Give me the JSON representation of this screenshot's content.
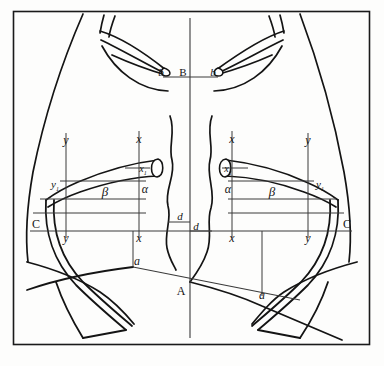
{
  "figure": {
    "background_color": "#fdfdfc",
    "ink_color": "#141414",
    "frame": {
      "stroke": "#1a1a1a",
      "x": 13,
      "y": 11,
      "width": 357,
      "height": 334
    }
  },
  "axes": {
    "midline_label": "vertical-midline",
    "midline_x": 190,
    "baseline_label": "horizontal-baseline",
    "baseline_y": 231
  },
  "labels": {
    "top_center": "B",
    "top_left_clavicle": "b",
    "top_right_clavicle": "b",
    "bottom_center": "A",
    "bottom_left_rib": "a",
    "bottom_right_rib": "a",
    "left_outer": "C",
    "right_outer": "C",
    "left_y_top": "y",
    "right_y_top": "y",
    "left_y_base": "y",
    "right_y_base": "y",
    "left_y_sub": "y",
    "right_y_sub": "y",
    "left_x_top": "x",
    "right_x_top": "x",
    "left_x_base": "x",
    "right_x_base": "x",
    "left_x_sub": "x",
    "right_x_sub": "x",
    "subscript": "1",
    "left_alpha": "α",
    "right_alpha": "α",
    "left_beta": "β",
    "right_beta": "β",
    "left_d": "d",
    "right_d": "d"
  },
  "measurement_points": [
    {
      "id": "B",
      "role": "suprasternal-notch",
      "x": 190,
      "y": 73
    },
    {
      "id": "A",
      "role": "xiphoid-apex",
      "x": 178,
      "y": 293
    },
    {
      "id": "b-left",
      "role": "clavicle-end-left",
      "x": 165,
      "y": 73
    },
    {
      "id": "b-right",
      "role": "clavicle-end-right",
      "x": 215,
      "y": 73
    },
    {
      "id": "a-left",
      "role": "costal-margin-left",
      "x": 133,
      "y": 267
    },
    {
      "id": "a-right",
      "role": "costal-margin-right",
      "x": 258,
      "y": 297
    },
    {
      "id": "C-left",
      "role": "lateral-chest-left",
      "x": 33,
      "y": 227
    },
    {
      "id": "C-right",
      "role": "lateral-chest-right",
      "x": 344,
      "y": 227
    }
  ],
  "grid_lines": {
    "left_vertical_y": 67,
    "left_vertical_x": 134,
    "right_vertical_x": 233,
    "right_vertical_y": 304,
    "upper_rail_y": 183,
    "alpha_rail_y": 183,
    "beta_rail_y": 183
  }
}
